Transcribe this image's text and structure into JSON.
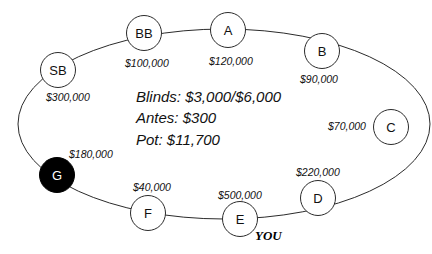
{
  "diagram": {
    "table_shape": "ellipse"
  },
  "center_info": {
    "blinds_line": "Blinds: $3,000/$6,000",
    "antes_line": "Antes: $300",
    "pot_line": "Pot: $11,700",
    "blinds_small": "$3,000",
    "blinds_big": "$6,000",
    "antes": "$300",
    "pot": "$11,700"
  },
  "hero": {
    "label": "YOU",
    "seat": "E"
  },
  "seats": [
    {
      "id": "SB",
      "label": "SB",
      "stack": "$300,000",
      "is_button": false,
      "cx": 58,
      "cy": 70,
      "r": 18,
      "stack_x": 46,
      "stack_y": 92
    },
    {
      "id": "BB",
      "label": "BB",
      "stack": "$100,000",
      "is_button": false,
      "cx": 144,
      "cy": 33,
      "r": 18,
      "stack_x": 125,
      "stack_y": 58
    },
    {
      "id": "A",
      "label": "A",
      "stack": "$120,000",
      "is_button": false,
      "cx": 228,
      "cy": 30,
      "r": 18,
      "stack_x": 209,
      "stack_y": 56
    },
    {
      "id": "B",
      "label": "B",
      "stack": "$90,000",
      "is_button": false,
      "cx": 322,
      "cy": 51,
      "r": 18,
      "stack_x": 300,
      "stack_y": 74
    },
    {
      "id": "C",
      "label": "C",
      "stack": "$70,000",
      "is_button": false,
      "cx": 391,
      "cy": 127,
      "r": 18,
      "stack_x": 328,
      "stack_y": 121
    },
    {
      "id": "D",
      "label": "D",
      "stack": "$220,000",
      "is_button": false,
      "cx": 318,
      "cy": 198,
      "r": 18,
      "stack_x": 296,
      "stack_y": 167
    },
    {
      "id": "E",
      "label": "E",
      "stack": "$500,000",
      "is_button": false,
      "cx": 240,
      "cy": 219,
      "r": 18,
      "stack_x": 218,
      "stack_y": 190
    },
    {
      "id": "F",
      "label": "F",
      "stack": "$40,000",
      "is_button": false,
      "cx": 148,
      "cy": 213,
      "r": 18,
      "stack_x": 133,
      "stack_y": 182
    },
    {
      "id": "G",
      "label": "G",
      "stack": "$180,000",
      "is_button": true,
      "cx": 57,
      "cy": 175,
      "r": 18,
      "stack_x": 69,
      "stack_y": 149
    }
  ],
  "colors": {
    "background": "#ffffff",
    "outline": "#2b2b2b",
    "text": "#111111",
    "button_fill": "#000000",
    "button_text": "#ffffff"
  },
  "table_path": {
    "cx": 224,
    "cy": 124,
    "rx": 206,
    "ry": 95
  }
}
